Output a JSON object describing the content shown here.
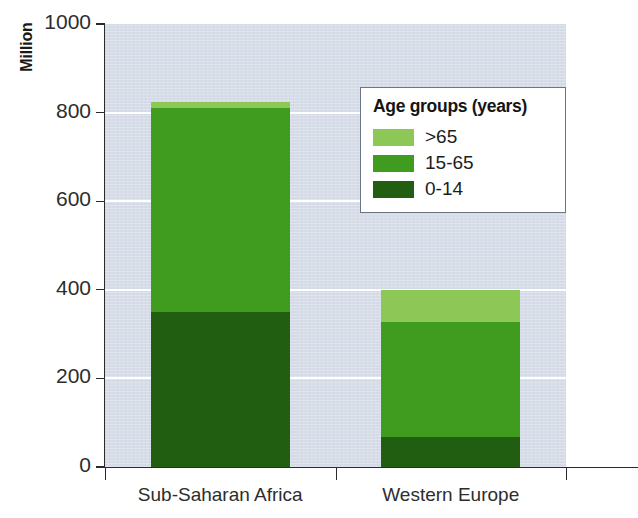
{
  "chart_data": {
    "type": "bar",
    "subtype": "stacked-bar",
    "title": "",
    "xlabel": "",
    "ylabel": "Million",
    "ylim": [
      0,
      1000
    ],
    "yticks": [
      0,
      200,
      400,
      600,
      800,
      1000
    ],
    "ytick_labels": [
      "0",
      "200",
      "400",
      "600",
      "800",
      "1000"
    ],
    "grid": "horizontal-white-gridlines",
    "categories": [
      "Sub-Saharan Africa",
      "Western Europe"
    ],
    "series": [
      {
        "name": "0-14",
        "values": [
          350,
          67
        ],
        "color": "#225e11"
      },
      {
        "name": "15-65",
        "values": [
          460,
          260
        ],
        "color": "#3f9c1e"
      },
      {
        "name": ">65",
        "values": [
          13,
          73
        ],
        "color": "#8dc756"
      }
    ],
    "totals": [
      823,
      400
    ],
    "legend_position": "inside-top-right",
    "legend_title": "Age groups (years)",
    "plot_background": "#d6dde9"
  },
  "axis": {
    "y_title": "Million",
    "y_ticks": [
      {
        "label": "1000",
        "value": 1000
      },
      {
        "label": "800",
        "value": 800
      },
      {
        "label": "600",
        "value": 600
      },
      {
        "label": "400",
        "value": 400
      },
      {
        "label": "200",
        "value": 200
      },
      {
        "label": "0",
        "value": 0
      }
    ],
    "x_ticks": [
      {
        "label": "Sub-Saharan Africa"
      },
      {
        "label": "Western Europe"
      }
    ]
  },
  "legend": {
    "title": "Age groups (years)",
    "items": [
      {
        "label": ">65",
        "color": "#8dc756"
      },
      {
        "label": "15-65",
        "color": "#3f9c1e"
      },
      {
        "label": "0-14",
        "color": "#225e11"
      }
    ]
  },
  "colors": {
    "light_green": "#8dc756",
    "mid_green": "#3f9c1e",
    "dark_green": "#225e11",
    "plot_background": "#d6dde9",
    "gridline": "#ffffff",
    "axis": "#2b2b2b",
    "legend_border": "#6c7486"
  }
}
